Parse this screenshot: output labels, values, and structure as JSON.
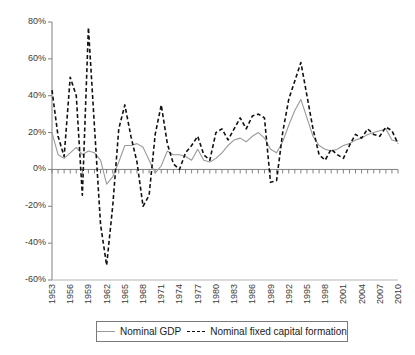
{
  "chart_data": {
    "type": "line",
    "title": "",
    "xlabel": "",
    "ylabel": "",
    "ylim": [
      -60,
      80
    ],
    "xlim": [
      1953,
      2010
    ],
    "grid": false,
    "legend_position": "bottom",
    "ytick_labels": [
      "80%",
      "60%",
      "40%",
      "20%",
      "0%",
      "-20%",
      "-40%",
      "-60%"
    ],
    "ytick_values": [
      80,
      60,
      40,
      20,
      0,
      -20,
      -40,
      -60
    ],
    "xtick_labels": [
      "1953",
      "1956",
      "1959",
      "1962",
      "1965",
      "1968",
      "1971",
      "1974",
      "1977",
      "1980",
      "1983",
      "1986",
      "1989",
      "1992",
      "1995",
      "1998",
      "2001",
      "2004",
      "2007",
      "2010"
    ],
    "xtick_values": [
      1953,
      1956,
      1959,
      1962,
      1965,
      1968,
      1971,
      1974,
      1977,
      1980,
      1983,
      1986,
      1989,
      1992,
      1995,
      1998,
      2001,
      2004,
      2007,
      2010
    ],
    "x": [
      1953,
      1954,
      1955,
      1956,
      1957,
      1958,
      1959,
      1960,
      1961,
      1962,
      1963,
      1964,
      1965,
      1966,
      1967,
      1968,
      1969,
      1970,
      1971,
      1972,
      1973,
      1974,
      1975,
      1976,
      1977,
      1978,
      1979,
      1980,
      1981,
      1982,
      1983,
      1984,
      1985,
      1986,
      1987,
      1988,
      1989,
      1990,
      1991,
      1992,
      1993,
      1994,
      1995,
      1996,
      1997,
      1998,
      1999,
      2000,
      2001,
      2002,
      2003,
      2004,
      2005,
      2006,
      2007,
      2008,
      2009,
      2010
    ],
    "series": [
      {
        "name": "Nominal GDP",
        "style": "solid",
        "color": "#9a9a9a",
        "values": [
          20,
          8,
          6,
          9,
          12,
          8,
          10,
          9,
          5,
          -8,
          -4,
          4,
          13,
          13,
          14,
          12,
          5,
          -2,
          2,
          10,
          8,
          8,
          7,
          5,
          11,
          5,
          4,
          6,
          9,
          13,
          16,
          17,
          15,
          18,
          20,
          17,
          11,
          9,
          15,
          24,
          32,
          38,
          28,
          18,
          13,
          11,
          10,
          11,
          13,
          14,
          16,
          17,
          19,
          20,
          21,
          22,
          16,
          15
        ]
      },
      {
        "name": "Nominal fixed capital formation",
        "style": "dashed",
        "color": "#111111",
        "values": [
          43,
          18,
          7,
          50,
          40,
          -14,
          77,
          23,
          -30,
          -52,
          -20,
          22,
          35,
          18,
          4,
          -20,
          -14,
          19,
          35,
          14,
          3,
          0,
          9,
          13,
          18,
          8,
          5,
          20,
          22,
          16,
          22,
          28,
          22,
          29,
          30,
          28,
          -7,
          -6,
          20,
          38,
          48,
          58,
          40,
          22,
          8,
          5,
          11,
          8,
          6,
          13,
          19,
          17,
          22,
          19,
          18,
          23,
          21,
          14
        ]
      }
    ]
  },
  "legend": {
    "entries": [
      {
        "label": "Nominal GDP",
        "marker": "solid-line-swatch"
      },
      {
        "label": "Nominal fixed capital formation",
        "marker": "dashed-line-swatch"
      }
    ]
  }
}
